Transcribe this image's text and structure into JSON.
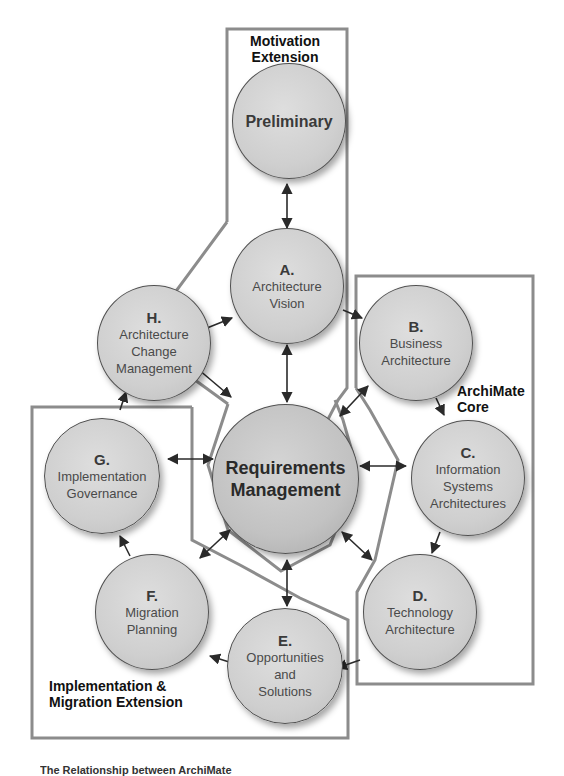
{
  "diagram": {
    "type": "TOGAF ADM cycle with ArchiMate coverage",
    "colors": {
      "node_fill": "#d2d2d2",
      "node_border": "#505050",
      "region_outline": "#8c8c8c",
      "arrow": "#2a2a2a",
      "label_text": "#111111"
    },
    "regions": [
      {
        "id": "motivation",
        "label_line1": "Motivation",
        "label_line2": "Extension"
      },
      {
        "id": "core",
        "label_line1": "ArchiMate",
        "label_line2": "Core"
      },
      {
        "id": "implementation",
        "label_line1": "Implementation &",
        "label_line2": "Migration Extension"
      }
    ],
    "nodes": {
      "preliminary": {
        "letter": "",
        "line1": "Preliminary",
        "line2": "",
        "line3": ""
      },
      "a": {
        "letter": "A.",
        "line1": "Architecture",
        "line2": "Vision",
        "line3": ""
      },
      "b": {
        "letter": "B.",
        "line1": "Business",
        "line2": "Architecture",
        "line3": ""
      },
      "c": {
        "letter": "C.",
        "line1": "Information",
        "line2": "Systems",
        "line3": "Architectures"
      },
      "d": {
        "letter": "D.",
        "line1": "Technology",
        "line2": "Architecture",
        "line3": ""
      },
      "e": {
        "letter": "E.",
        "line1": "Opportunities",
        "line2": "and",
        "line3": "Solutions"
      },
      "f": {
        "letter": "F.",
        "line1": "Migration",
        "line2": "Planning",
        "line3": ""
      },
      "g": {
        "letter": "G.",
        "line1": "Implementation",
        "line2": "Governance",
        "line3": ""
      },
      "h": {
        "letter": "H.",
        "line1": "Architecture",
        "line2": "Change",
        "line3": "Management"
      },
      "rm": {
        "letter": "",
        "line1": "Requirements",
        "line2": "Management",
        "line3": ""
      }
    },
    "edges": [
      {
        "from": "preliminary",
        "to": "a",
        "bidirectional": true
      },
      {
        "from": "a",
        "to": "b",
        "bidirectional": false
      },
      {
        "from": "b",
        "to": "c",
        "bidirectional": false
      },
      {
        "from": "c",
        "to": "d",
        "bidirectional": false
      },
      {
        "from": "d",
        "to": "e",
        "bidirectional": false
      },
      {
        "from": "e",
        "to": "f",
        "bidirectional": false
      },
      {
        "from": "f",
        "to": "g",
        "bidirectional": false
      },
      {
        "from": "g",
        "to": "h",
        "bidirectional": false
      },
      {
        "from": "h",
        "to": "a",
        "bidirectional": false
      },
      {
        "from": "rm",
        "to": "a",
        "bidirectional": true
      },
      {
        "from": "rm",
        "to": "b",
        "bidirectional": true
      },
      {
        "from": "rm",
        "to": "c",
        "bidirectional": true
      },
      {
        "from": "rm",
        "to": "d",
        "bidirectional": true
      },
      {
        "from": "rm",
        "to": "e",
        "bidirectional": true
      },
      {
        "from": "rm",
        "to": "f",
        "bidirectional": true
      },
      {
        "from": "rm",
        "to": "g",
        "bidirectional": true
      },
      {
        "from": "rm",
        "to": "h",
        "bidirectional": true
      }
    ],
    "caption": "The Relationship between ArchiMate"
  }
}
